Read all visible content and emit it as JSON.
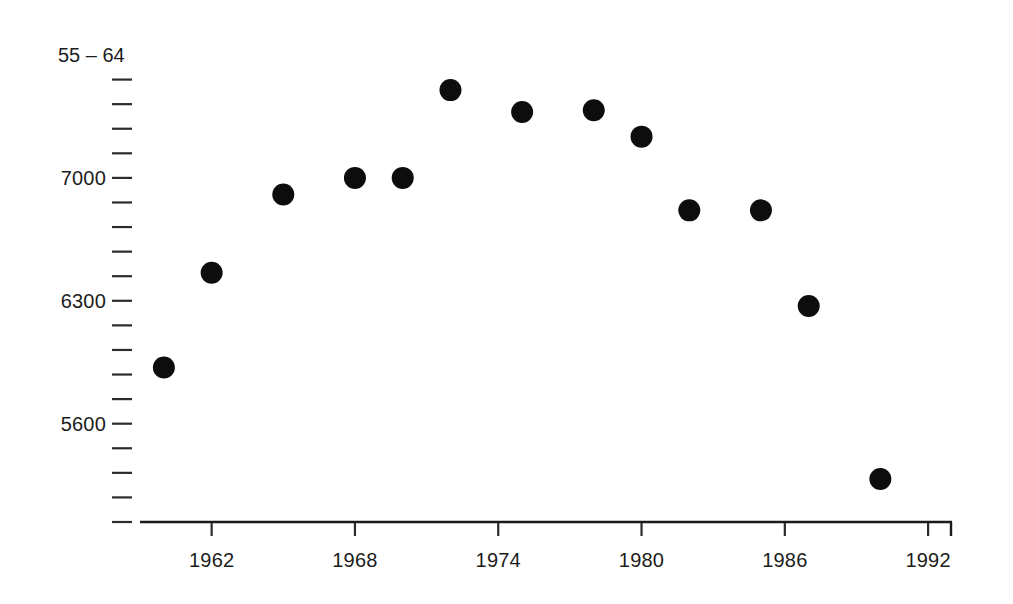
{
  "chart_data": {
    "type": "scatter",
    "title": "55 – 64",
    "xlabel": "",
    "ylabel": "",
    "xlim": [
      1959,
      1993
    ],
    "ylim": [
      5040,
      7700
    ],
    "grid": false,
    "legend_position": "none",
    "marker": "filled-circle",
    "marker_color": "#0d0d0d",
    "marker_size": 11,
    "x_tick_labels": [
      "1962",
      "1968",
      "1974",
      "1980",
      "1986",
      "1992"
    ],
    "x_tick_values": [
      1962,
      1968,
      1974,
      1980,
      1986,
      1992
    ],
    "y_tick_labels": [
      "7000",
      "6300",
      "5600"
    ],
    "y_tick_values": [
      7000,
      6300,
      5600
    ],
    "y_minor_tick_values": [
      7560,
      7420,
      7280,
      7140,
      6860,
      6720,
      6580,
      6440,
      6160,
      6020,
      5880,
      5740,
      5460,
      5320,
      5180,
      5040
    ],
    "x": [
      1960,
      1962,
      1965,
      1968,
      1970,
      1972,
      1975,
      1978,
      1980,
      1982,
      1985,
      1987,
      1990
    ],
    "y": [
      5920,
      6460,
      6905,
      7000,
      7000,
      7500,
      7375,
      7385,
      7235,
      6815,
      6815,
      6270,
      5285
    ],
    "points": [
      {
        "year": 1960,
        "value": 5920
      },
      {
        "year": 1962,
        "value": 6460
      },
      {
        "year": 1965,
        "value": 6905
      },
      {
        "year": 1968,
        "value": 7000
      },
      {
        "year": 1970,
        "value": 7000
      },
      {
        "year": 1972,
        "value": 7500
      },
      {
        "year": 1975,
        "value": 7375
      },
      {
        "year": 1978,
        "value": 7385
      },
      {
        "year": 1980,
        "value": 7235
      },
      {
        "year": 1982,
        "value": 6815
      },
      {
        "year": 1985,
        "value": 6815
      },
      {
        "year": 1987,
        "value": 6270
      },
      {
        "year": 1990,
        "value": 5285
      }
    ]
  },
  "figure": {
    "background_color": "#ffffff",
    "axis_color": "#1a1a1a",
    "text_color": "#1c1c1c"
  }
}
